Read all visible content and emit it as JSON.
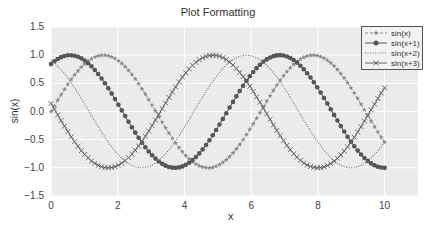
{
  "chart_data": {
    "type": "line",
    "title": "Plot Formatting",
    "xlabel": "x",
    "ylabel": "sin(x)",
    "xlim": [
      0,
      11
    ],
    "ylim": [
      -1.5,
      1.5
    ],
    "xticks": [
      0,
      2,
      4,
      6,
      8,
      10
    ],
    "yticks": [
      -1.5,
      -1.0,
      -0.5,
      0.0,
      0.5,
      1.0,
      1.5
    ],
    "xtick_labels": [
      "0",
      "2",
      "4",
      "6",
      "8",
      "10"
    ],
    "ytick_labels": [
      "−1.5",
      "−1.0",
      "−0.5",
      "0.0",
      "0.5",
      "1.0",
      "1.5"
    ],
    "grid": true,
    "background": "#ebebeb",
    "legend_position": "upper right",
    "x_range": {
      "start": 0,
      "end": 10,
      "points": 100
    },
    "series": [
      {
        "name": "sin(x)",
        "expr": "sin(x)",
        "phase": 0,
        "linestyle": "dashed",
        "marker": "star",
        "color": "#888888"
      },
      {
        "name": "sin(x+1)",
        "expr": "sin(x+1)",
        "phase": 1,
        "linestyle": "solid",
        "marker": "circle",
        "color": "#555555"
      },
      {
        "name": "sin(x+2)",
        "expr": "sin(x+2)",
        "phase": 2,
        "linestyle": "dotted",
        "marker": "none",
        "color": "#777777"
      },
      {
        "name": "sin(x+3)",
        "expr": "sin(x+3)",
        "phase": 3,
        "linestyle": "solid",
        "marker": "x",
        "color": "#666666"
      }
    ]
  }
}
